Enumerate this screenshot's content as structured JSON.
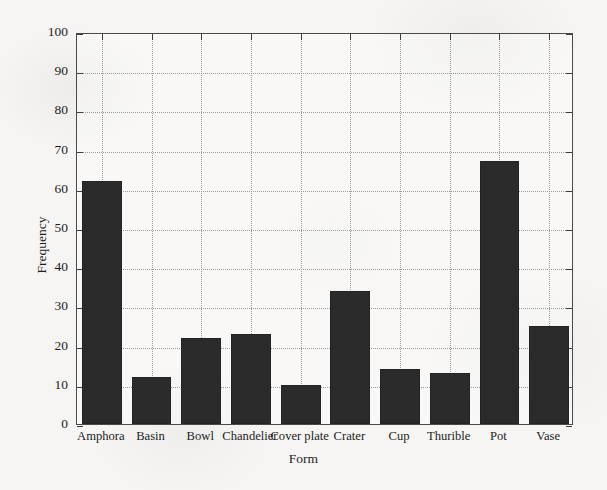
{
  "chart_data": {
    "type": "bar",
    "title": "",
    "xlabel": "Form",
    "ylabel": "Frequency",
    "categories": [
      "Amphora",
      "Basin",
      "Bowl",
      "Chandelier",
      "Cover plate",
      "Crater",
      "Cup",
      "Thurible",
      "Pot",
      "Vase"
    ],
    "values": [
      62,
      12,
      22,
      23,
      10,
      34,
      14,
      13,
      67,
      25
    ],
    "ylim": [
      0,
      100
    ],
    "ytick_labels": [
      "0",
      "10",
      "20",
      "30",
      "40",
      "50",
      "60",
      "70",
      "80",
      "90",
      "100"
    ],
    "ytick_values": [
      0,
      10,
      20,
      30,
      40,
      50,
      60,
      70,
      80,
      90,
      100
    ],
    "grid": "dotted",
    "legend": "none",
    "bar_color": "#2b2b2b",
    "axis_color": "#4a4a4a",
    "grid_color": "#9a9a9a",
    "background_color": "#f6f5f3"
  }
}
